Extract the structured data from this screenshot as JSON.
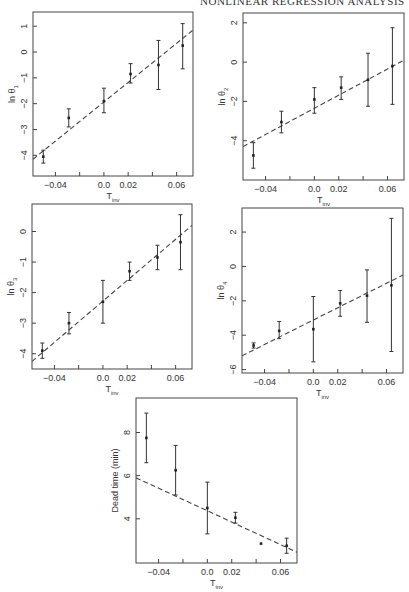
{
  "header": {
    "text": "NONLINEAR REGRESSION ANALYSIS"
  },
  "chart_data": [
    {
      "type": "scatter",
      "id": "theta1",
      "title": "",
      "xlabel": "T",
      "xlabel_sub": "inv",
      "ylabel": "ln θ",
      "ylabel_sub": "1",
      "xlim": [
        -0.0585,
        0.0735
      ],
      "ylim": [
        -4.8,
        1.55
      ],
      "xticks": [
        -0.04,
        -0.02,
        0.0,
        0.02,
        0.04,
        0.06
      ],
      "xtick_labels": [
        "-0.04",
        "",
        "0.0",
        "0.02",
        "",
        "0.06"
      ],
      "yticks": [
        1,
        0,
        -1,
        -2,
        -3,
        -4
      ],
      "ytick_labels": [
        "1",
        "0",
        "-1",
        "-2",
        "-3",
        "-4"
      ],
      "points": [
        {
          "x": -0.05,
          "y": -4.05,
          "lo": -4.3,
          "hi": -3.8
        },
        {
          "x": -0.029,
          "y": -2.55,
          "lo": -2.9,
          "hi": -2.2
        },
        {
          "x": 0.0,
          "y": -1.9,
          "lo": -2.35,
          "hi": -1.4
        },
        {
          "x": 0.022,
          "y": -0.85,
          "lo": -1.2,
          "hi": -0.45
        },
        {
          "x": 0.045,
          "y": -0.5,
          "lo": -1.45,
          "hi": 0.45
        },
        {
          "x": 0.065,
          "y": 0.25,
          "lo": -0.65,
          "hi": 1.1
        }
      ],
      "fit": {
        "x": [
          -0.0585,
          0.0735
        ],
        "y": [
          -4.15,
          0.85
        ]
      }
    },
    {
      "type": "scatter",
      "id": "theta2",
      "xlabel": "T",
      "xlabel_sub": "inv",
      "ylabel": "ln θ",
      "ylabel_sub": "2",
      "xlim": [
        -0.0585,
        0.0735
      ],
      "ylim": [
        -6.0,
        2.5
      ],
      "xticks": [
        -0.04,
        -0.02,
        0.0,
        0.02,
        0.04,
        0.06
      ],
      "xtick_labels": [
        "-0.04",
        "",
        "0.0",
        "0.02",
        "",
        "0.06"
      ],
      "yticks": [
        2,
        0,
        -2,
        -4
      ],
      "ytick_labels": [
        "2",
        "0",
        "-2",
        "-4"
      ],
      "points": [
        {
          "x": -0.05,
          "y": -4.75,
          "lo": -5.4,
          "hi": -4.1
        },
        {
          "x": -0.027,
          "y": -3.05,
          "lo": -3.6,
          "hi": -2.5
        },
        {
          "x": 0.0,
          "y": -1.9,
          "lo": -2.6,
          "hi": -1.3
        },
        {
          "x": 0.022,
          "y": -1.3,
          "lo": -1.9,
          "hi": -0.75
        },
        {
          "x": 0.044,
          "y": -0.9,
          "lo": -2.25,
          "hi": 0.45
        },
        {
          "x": 0.064,
          "y": -0.2,
          "lo": -2.15,
          "hi": 1.75
        }
      ],
      "fit": {
        "x": [
          -0.0585,
          0.0735
        ],
        "y": [
          -4.3,
          0.1
        ]
      }
    },
    {
      "type": "scatter",
      "id": "theta3",
      "xlabel": "T",
      "xlabel_sub": "inv",
      "ylabel": "ln θ",
      "ylabel_sub": "3",
      "xlim": [
        -0.0585,
        0.0735
      ],
      "ylim": [
        -4.5,
        0.9
      ],
      "xticks": [
        -0.04,
        -0.02,
        0.0,
        0.02,
        0.04,
        0.06
      ],
      "xtick_labels": [
        "-0.04",
        "",
        "0.0",
        "0.02",
        "",
        "0.06"
      ],
      "yticks": [
        0,
        -1,
        -2,
        -3,
        -4
      ],
      "ytick_labels": [
        "0",
        "-1",
        "-2",
        "-3",
        "-4"
      ],
      "points": [
        {
          "x": -0.05,
          "y": -3.9,
          "lo": -4.15,
          "hi": -3.65
        },
        {
          "x": -0.028,
          "y": -3.0,
          "lo": -3.35,
          "hi": -2.65
        },
        {
          "x": 0.0,
          "y": -2.3,
          "lo": -3.0,
          "hi": -1.6
        },
        {
          "x": 0.022,
          "y": -1.3,
          "lo": -1.6,
          "hi": -1.0
        },
        {
          "x": 0.045,
          "y": -0.85,
          "lo": -1.25,
          "hi": -0.45
        },
        {
          "x": 0.064,
          "y": -0.35,
          "lo": -1.25,
          "hi": 0.55
        }
      ],
      "fit": {
        "x": [
          -0.0585,
          0.0735
        ],
        "y": [
          -4.25,
          0.2
        ]
      }
    },
    {
      "type": "scatter",
      "id": "theta4",
      "xlabel": "T",
      "xlabel_sub": "inv",
      "ylabel": "ln θ",
      "ylabel_sub": "4",
      "xlim": [
        -0.0585,
        0.0735
      ],
      "ylim": [
        -6.2,
        3.4
      ],
      "xticks": [
        -0.04,
        -0.02,
        0.0,
        0.02,
        0.04,
        0.06
      ],
      "xtick_labels": [
        "-0.04",
        "",
        "0.0",
        "0.02",
        "",
        "0.06"
      ],
      "yticks": [
        2,
        0,
        -2,
        -4,
        -6
      ],
      "ytick_labels": [
        "2",
        "0",
        "-2",
        "-4",
        "-6"
      ],
      "points": [
        {
          "x": -0.049,
          "y": -4.6,
          "lo": -4.75,
          "hi": -4.45
        },
        {
          "x": -0.028,
          "y": -3.75,
          "lo": -4.2,
          "hi": -3.2
        },
        {
          "x": 0.0,
          "y": -3.65,
          "lo": -5.55,
          "hi": -1.75
        },
        {
          "x": 0.022,
          "y": -2.15,
          "lo": -2.9,
          "hi": -1.4
        },
        {
          "x": 0.044,
          "y": -1.7,
          "lo": -3.25,
          "hi": -0.2
        },
        {
          "x": 0.064,
          "y": -1.1,
          "lo": -4.95,
          "hi": 2.8
        }
      ],
      "fit": {
        "x": [
          -0.0585,
          0.0735
        ],
        "y": [
          -5.2,
          -0.5
        ]
      }
    },
    {
      "type": "scatter",
      "id": "deadtime",
      "xlabel": "T",
      "xlabel_sub": "inv",
      "ylabel": "Dead time (min)",
      "ylabel_sub": "",
      "xlim": [
        -0.0585,
        0.0735
      ],
      "ylim": [
        1.95,
        9.6
      ],
      "xticks": [
        -0.04,
        -0.02,
        0.0,
        0.02,
        0.04,
        0.06
      ],
      "xtick_labels": [
        "-0.04",
        "",
        "0.0",
        "0.02",
        "",
        "0.06"
      ],
      "yticks": [
        8,
        6,
        4
      ],
      "ytick_labels": [
        "8",
        "6",
        "4"
      ],
      "points": [
        {
          "x": -0.05,
          "y": 7.75,
          "lo": 6.6,
          "hi": 8.9
        },
        {
          "x": -0.026,
          "y": 6.25,
          "lo": 5.1,
          "hi": 7.4
        },
        {
          "x": 0.0,
          "y": 4.5,
          "lo": 3.3,
          "hi": 5.7
        },
        {
          "x": 0.023,
          "y": 4.05,
          "lo": 3.8,
          "hi": 4.3
        },
        {
          "x": 0.044,
          "y": 2.85,
          "lo": null,
          "hi": null
        },
        {
          "x": 0.065,
          "y": 2.75,
          "lo": 2.4,
          "hi": 3.1
        }
      ],
      "fit": {
        "x": [
          -0.0585,
          0.0735
        ],
        "y": [
          5.9,
          2.45
        ]
      }
    }
  ]
}
